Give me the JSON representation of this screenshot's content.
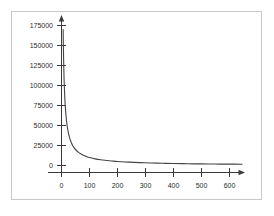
{
  "chart_data": {
    "type": "line",
    "title": "",
    "subtitle": "",
    "xlabel": "",
    "ylabel": "",
    "xlim": [
      -30,
      660
    ],
    "ylim": [
      0,
      180000
    ],
    "grid": false,
    "legend": null,
    "x_ticks": [
      0,
      100,
      200,
      300,
      400,
      500,
      600
    ],
    "x_tick_labels": [
      "0",
      "100",
      "200",
      "300",
      "400",
      "500",
      "600"
    ],
    "y_ticks": [
      0,
      25000,
      50000,
      75000,
      100000,
      125000,
      150000,
      175000
    ],
    "y_tick_labels": [
      "0",
      "25000",
      "50000",
      "75000",
      "100000",
      "125000",
      "150000",
      "175000"
    ],
    "series": [
      {
        "name": "decay-curve",
        "color": "#444444",
        "x": [
          5.9,
          6.5,
          7,
          8,
          9,
          10,
          12,
          14,
          16,
          18,
          20,
          24,
          28,
          32,
          36,
          40,
          45,
          50,
          60,
          70,
          80,
          90,
          100,
          120,
          140,
          160,
          180,
          200,
          240,
          280,
          320,
          360,
          400,
          450,
          500,
          550,
          600,
          645
        ],
        "y": [
          170000,
          154000,
          143000,
          125000,
          111000,
          100000,
          83300,
          71400,
          62500,
          55600,
          50000,
          41700,
          35700,
          31300,
          27800,
          25000,
          22200,
          20000,
          16700,
          14300,
          12500,
          11100,
          10000,
          8300,
          7100,
          6300,
          5600,
          5000,
          4200,
          3600,
          3100,
          2800,
          2500,
          2200,
          2000,
          1800,
          1700,
          1550
        ]
      }
    ],
    "axis_style": {
      "x_axis_arrow": true,
      "y_axis_arrow": true,
      "axis_color": "#3a3a3a",
      "frame_color": "#c8c8c8",
      "background": "#ffffff"
    }
  }
}
